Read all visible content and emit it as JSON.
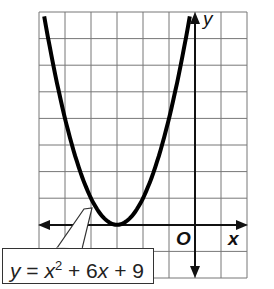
{
  "chart_data": {
    "type": "line",
    "title": "",
    "xlabel": "x",
    "ylabel": "y",
    "origin_label": "O",
    "xlim": [
      -6,
      2
    ],
    "ylim": [
      -2,
      8
    ],
    "grid": true,
    "series": [
      {
        "name": "y = x^2 + 6x + 9",
        "x": [
          -5.8,
          -5,
          -4,
          -3,
          -2,
          -1,
          -0.2
        ],
        "y": [
          7.84,
          4,
          1,
          0,
          1,
          4,
          7.84
        ]
      }
    ],
    "annotations": [
      "y = x² + 6x + 9"
    ],
    "vertex": [
      -3,
      0
    ]
  },
  "labels": {
    "x_axis": "x",
    "y_axis": "y",
    "origin": "O",
    "equation_lhs": "y",
    "equation_eq": " = ",
    "equation_var": "x",
    "equation_exp": "2",
    "equation_rest": " + 6",
    "equation_var2": "x",
    "equation_tail": " + 9"
  }
}
